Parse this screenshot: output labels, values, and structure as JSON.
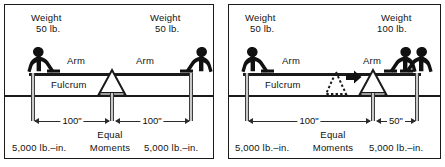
{
  "figure": {
    "panels": [
      {
        "id": "equal-arms",
        "left_weight": {
          "line1": "Weight",
          "line2": "50 lb."
        },
        "right_weight": {
          "line1": "Weight",
          "line2": "50 lb."
        },
        "left_arm_label": "Arm",
        "right_arm_label": "Arm",
        "fulcrum_label": "Fulcrum",
        "left_dimension": "100\"",
        "right_dimension": "100\"",
        "center_caption_line1": "Equal",
        "center_caption_line2": "Moments",
        "left_moment": "5,000 lb.–in.",
        "right_moment": "5,000 lb.–in.",
        "riders": {
          "left": 1,
          "right": 1
        },
        "fulcrum_moved": false
      },
      {
        "id": "unequal-arms",
        "left_weight": {
          "line1": "Weight",
          "line2": "50 lb."
        },
        "right_weight": {
          "line1": "Weight",
          "line2": "100 lb."
        },
        "left_arm_label": "Arm",
        "right_arm_label": "Arm",
        "fulcrum_label": "Fulcrum",
        "left_dimension": "100\"",
        "right_dimension": "50\"",
        "center_caption_line1": "Equal",
        "center_caption_line2": "Moments",
        "left_moment": "5,000 lb.–in.",
        "right_moment": "5,000 lb.–in.",
        "riders": {
          "left": 1,
          "right": 2
        },
        "fulcrum_moved": true,
        "move_arrow": "right-arrow-icon",
        "ghost_fulcrum": "dashed-triangle-icon"
      }
    ],
    "colors": {
      "ink": "#1a1a1a",
      "post_fill": "#c9c9c9",
      "background": "#ffffff",
      "dimension": "#2b2b2b"
    }
  }
}
